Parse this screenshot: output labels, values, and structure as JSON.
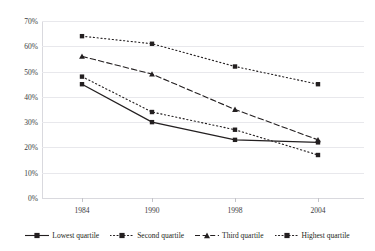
{
  "chart_data": {
    "type": "line",
    "title": "",
    "subtitle": "",
    "xlabel": "",
    "ylabel": "",
    "categories": [
      "1984",
      "1990",
      "1998",
      "2004"
    ],
    "x_tick_labels": [
      "1984",
      "1990",
      "1998",
      "2004"
    ],
    "y_tick_labels": [
      "0%",
      "10%",
      "20%",
      "30%",
      "40%",
      "50%",
      "60%",
      "70%"
    ],
    "y_tick_values": [
      0,
      10,
      20,
      30,
      40,
      50,
      60,
      70
    ],
    "ylim": [
      0,
      70
    ],
    "y_unit": "%",
    "grid": "horizontal",
    "legend_position": "bottom",
    "series": [
      {
        "name": "Lowest quartile",
        "values": [
          45,
          30,
          23,
          22
        ],
        "line_style": "solid",
        "marker": "square",
        "color": "#231f20"
      },
      {
        "name": "Second quartile",
        "values": [
          48,
          34,
          27,
          17
        ],
        "line_style": "dotted",
        "marker": "square",
        "color": "#231f20"
      },
      {
        "name": "Third quartile",
        "values": [
          56,
          49,
          35,
          23
        ],
        "line_style": "dashed",
        "marker": "triangle",
        "color": "#231f20"
      },
      {
        "name": "Highest quartile",
        "values": [
          64,
          61,
          52,
          45
        ],
        "line_style": "dotted",
        "marker": "square",
        "color": "#231f20"
      }
    ]
  },
  "top_cut_text": "",
  "legend": {
    "items": [
      {
        "label": "Lowest quartile"
      },
      {
        "label": "Second quartile"
      },
      {
        "label": "Third quartile"
      },
      {
        "label": "Highest quartile"
      }
    ]
  },
  "colors": {
    "ink": "#231f20",
    "grid": "#e8e8ec",
    "axis": "#d9d9de",
    "background": "#ffffff"
  }
}
